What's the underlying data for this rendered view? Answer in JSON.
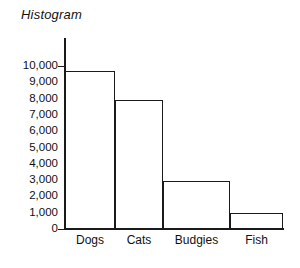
{
  "chart_data": {
    "type": "bar",
    "title": "Histogram",
    "xlabel": "",
    "ylabel": "",
    "categories": [
      "Dogs",
      "Cats",
      "Budgies",
      "Fish"
    ],
    "values": [
      9700,
      7900,
      2950,
      1000
    ],
    "ylim": [
      0,
      10000
    ],
    "ytick_labels": [
      "10,000",
      "9,000",
      "8,000",
      "7,000",
      "6,000",
      "5,000",
      "4,000",
      "3,000",
      "2,000",
      "1,000",
      "0"
    ],
    "ytick_values": [
      10000,
      9000,
      8000,
      7000,
      6000,
      5000,
      4000,
      3000,
      2000,
      1000,
      0
    ],
    "grid": false,
    "legend": null,
    "bar_style": "outlined-unfilled",
    "colors": {
      "axis": "#1a1a1a",
      "bar_outline": "#1a1a1a",
      "bar_fill": "transparent",
      "text": "#111111",
      "background": "#ffffff"
    }
  }
}
